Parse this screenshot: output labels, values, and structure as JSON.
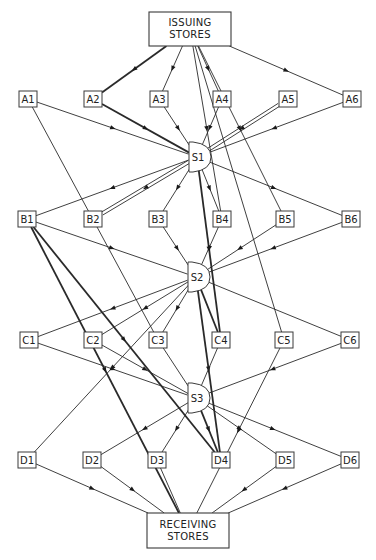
{
  "issuing": {
    "id": "IS",
    "line1": "ISSUING",
    "line2": "STORES",
    "x": 149,
    "y": 12,
    "w": 82,
    "h": 34
  },
  "receiving": {
    "id": "RS",
    "line1": "RECEIVING",
    "line2": "STORES",
    "x": 147,
    "y": 513,
    "w": 82,
    "h": 35
  },
  "rows": [
    {
      "row": "A",
      "y": 99,
      "nodes": [
        {
          "id": "A1",
          "label": "A1",
          "x": 28
        },
        {
          "id": "A2",
          "label": "A2",
          "x": 93
        },
        {
          "id": "A3",
          "label": "A3",
          "x": 159
        },
        {
          "id": "A4",
          "label": "A4",
          "x": 222
        },
        {
          "id": "A5",
          "label": "A5",
          "x": 288
        },
        {
          "id": "A6",
          "label": "A6",
          "x": 352
        }
      ]
    },
    {
      "row": "B",
      "y": 219,
      "nodes": [
        {
          "id": "B1",
          "label": "B1",
          "x": 27
        },
        {
          "id": "B2",
          "label": "B2",
          "x": 93
        },
        {
          "id": "B3",
          "label": "B3",
          "x": 158
        },
        {
          "id": "B4",
          "label": "B4",
          "x": 222
        },
        {
          "id": "B5",
          "label": "B5",
          "x": 285
        },
        {
          "id": "B6",
          "label": "B6",
          "x": 351
        }
      ]
    },
    {
      "row": "C",
      "y": 340,
      "nodes": [
        {
          "id": "C1",
          "label": "C1",
          "x": 29
        },
        {
          "id": "C2",
          "label": "C2",
          "x": 93
        },
        {
          "id": "C3",
          "label": "C3",
          "x": 158
        },
        {
          "id": "C4",
          "label": "C4",
          "x": 221
        },
        {
          "id": "C5",
          "label": "C5",
          "x": 284
        },
        {
          "id": "C6",
          "label": "C6",
          "x": 350
        }
      ]
    },
    {
      "row": "D",
      "y": 460,
      "nodes": [
        {
          "id": "D1",
          "label": "D1",
          "x": 27
        },
        {
          "id": "D2",
          "label": "D2",
          "x": 92
        },
        {
          "id": "D3",
          "label": "D3",
          "x": 157
        },
        {
          "id": "D4",
          "label": "D4",
          "x": 221
        },
        {
          "id": "D5",
          "label": "D5",
          "x": 285
        },
        {
          "id": "D6",
          "label": "D6",
          "x": 350
        }
      ]
    }
  ],
  "switches": [
    {
      "id": "S1",
      "label": "S1",
      "x": 197,
      "y": 157
    },
    {
      "id": "S2",
      "label": "S2",
      "x": 196,
      "y": 277
    },
    {
      "id": "S3",
      "label": "S3",
      "x": 196,
      "y": 398
    }
  ],
  "edges": [
    {
      "from": "IS",
      "to": "A2",
      "style": "heavy",
      "arrow": true
    },
    {
      "from": "IS",
      "to": "A3",
      "style": "normal",
      "arrow": true
    },
    {
      "from": "IS",
      "to": "A4",
      "style": "normal",
      "arrow": true
    },
    {
      "from": "IS",
      "to": "A6",
      "style": "normal",
      "arrow": true
    },
    {
      "from": "IS",
      "to": "B4",
      "style": "normal",
      "arrow": true
    },
    {
      "from": "IS",
      "to": "B5",
      "style": "normal",
      "arrow": true
    },
    {
      "from": "IS",
      "to": "C5",
      "style": "normal",
      "arrow": false
    },
    {
      "from": "A1",
      "to": "S1",
      "style": "normal",
      "arrow": true
    },
    {
      "from": "A2",
      "to": "S1",
      "style": "heavy",
      "arrow": true
    },
    {
      "from": "A3",
      "to": "S1",
      "style": "normal",
      "arrow": true
    },
    {
      "from": "A4",
      "to": "S1",
      "style": "normal",
      "arrow": true
    },
    {
      "from": "A5",
      "to": "S1",
      "style": "double",
      "arrow": true
    },
    {
      "from": "A6",
      "to": "S1",
      "style": "normal",
      "arrow": true
    },
    {
      "from": "A1",
      "to": "C3",
      "style": "normal",
      "arrow": true
    },
    {
      "from": "S1",
      "to": "B1",
      "style": "normal",
      "arrow": true
    },
    {
      "from": "S1",
      "to": "B2",
      "style": "double",
      "arrow": true
    },
    {
      "from": "S1",
      "to": "B3",
      "style": "normal",
      "arrow": true
    },
    {
      "from": "S1",
      "to": "B4",
      "style": "normal",
      "arrow": true
    },
    {
      "from": "S1",
      "to": "B6",
      "style": "normal",
      "arrow": true
    },
    {
      "from": "S1",
      "to": "C4",
      "style": "heavy",
      "arrow": true
    },
    {
      "from": "B1",
      "to": "S2",
      "style": "normal",
      "arrow": true
    },
    {
      "from": "B3",
      "to": "S2",
      "style": "normal",
      "arrow": true
    },
    {
      "from": "B4",
      "to": "S2",
      "style": "normal",
      "arrow": true
    },
    {
      "from": "B5",
      "to": "S2",
      "style": "normal",
      "arrow": true
    },
    {
      "from": "B6",
      "to": "S2",
      "style": "normal",
      "arrow": true
    },
    {
      "from": "B1",
      "to": "RS",
      "style": "heavy",
      "arrow": true
    },
    {
      "from": "B1",
      "to": "D4",
      "style": "heavy",
      "arrow": true
    },
    {
      "from": "S2",
      "to": "C1",
      "style": "normal",
      "arrow": true
    },
    {
      "from": "S2",
      "to": "C2",
      "style": "normal",
      "arrow": true
    },
    {
      "from": "S2",
      "to": "C3",
      "style": "normal",
      "arrow": true
    },
    {
      "from": "S2",
      "to": "C4",
      "style": "heavy",
      "arrow": false
    },
    {
      "from": "S2",
      "to": "C6",
      "style": "normal",
      "arrow": false
    },
    {
      "from": "S2",
      "to": "D1",
      "style": "normal",
      "arrow": true
    },
    {
      "from": "S2",
      "to": "D4",
      "style": "heavy",
      "arrow": true
    },
    {
      "from": "C1",
      "to": "S3",
      "style": "normal",
      "arrow": true
    },
    {
      "from": "C2",
      "to": "S3",
      "style": "normal",
      "arrow": true
    },
    {
      "from": "C3",
      "to": "S3",
      "style": "normal",
      "arrow": false
    },
    {
      "from": "C4",
      "to": "S3",
      "style": "normal",
      "arrow": false
    },
    {
      "from": "C6",
      "to": "S3",
      "style": "normal",
      "arrow": true
    },
    {
      "from": "C5",
      "to": "RS",
      "style": "normal",
      "arrow": true
    },
    {
      "from": "S3",
      "to": "D2",
      "style": "normal",
      "arrow": true
    },
    {
      "from": "S3",
      "to": "D3",
      "style": "normal",
      "arrow": true
    },
    {
      "from": "S3",
      "to": "D4",
      "style": "heavy",
      "arrow": true
    },
    {
      "from": "S3",
      "to": "D5",
      "style": "normal",
      "arrow": true
    },
    {
      "from": "S3",
      "to": "D6",
      "style": "normal",
      "arrow": true
    },
    {
      "from": "D1",
      "to": "RS",
      "style": "normal",
      "arrow": true
    },
    {
      "from": "D2",
      "to": "RS",
      "style": "normal",
      "arrow": true
    },
    {
      "from": "D3",
      "to": "RS",
      "style": "normal",
      "arrow": false
    },
    {
      "from": "D5",
      "to": "RS",
      "style": "normal",
      "arrow": true
    },
    {
      "from": "D6",
      "to": "RS",
      "style": "normal",
      "arrow": true
    }
  ]
}
